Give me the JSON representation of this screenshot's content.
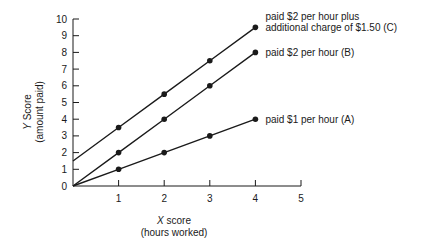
{
  "chart_data": {
    "type": "line",
    "title": "",
    "xlabel": "X score",
    "xlabel_sub": "(hours worked)",
    "ylabel": "Y Score",
    "ylabel_sub": "(amount paid)",
    "xlim": [
      0,
      5
    ],
    "ylim": [
      0,
      10
    ],
    "x_ticks": [
      1,
      2,
      3,
      4,
      5
    ],
    "y_ticks": [
      0,
      1,
      2,
      3,
      4,
      5,
      6,
      7,
      8,
      9,
      10
    ],
    "grid": false,
    "legend_position": "inline-right",
    "series": [
      {
        "name": "paid $2 per hour plus additional charge of $1.50 (C)",
        "label_lines": [
          "paid $2 per hour plus",
          "additional charge of $1.50 (C)"
        ],
        "line_start": [
          0,
          1.5
        ],
        "x": [
          1,
          2,
          3,
          4
        ],
        "values": [
          3.5,
          5.5,
          7.5,
          9.5
        ]
      },
      {
        "name": "paid $2 per hour (B)",
        "label_lines": [
          "paid $2 per hour (B)"
        ],
        "line_start": [
          0,
          0
        ],
        "x": [
          1,
          2,
          3,
          4
        ],
        "values": [
          2,
          4,
          6,
          8
        ]
      },
      {
        "name": "paid $1 per hour (A)",
        "label_lines": [
          "paid $1 per hour (A)"
        ],
        "line_start": [
          0,
          0
        ],
        "x": [
          1,
          2,
          3,
          4
        ],
        "values": [
          1,
          2,
          3,
          4
        ]
      }
    ]
  },
  "colors": {
    "line": "#1a1a1a",
    "background": "#ffffff"
  }
}
